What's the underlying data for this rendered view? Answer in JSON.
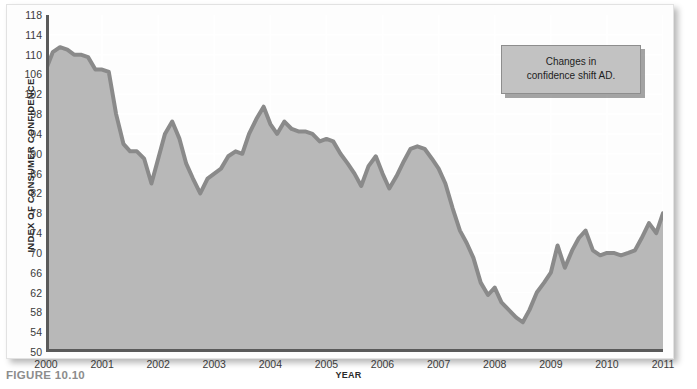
{
  "figure": {
    "caption": "FIGURE 10.10"
  },
  "annotation": {
    "line1": "Changes in",
    "line2": "confidence shift AD."
  },
  "colors": {
    "area_fill": "#b8b8b8",
    "line": "#8a8a8a",
    "gridline": "#ffffff",
    "axis": "#5a5a5a",
    "callout_fill": "#c2c2c2",
    "callout_border": "#8d8d8d",
    "caption_text": "#8c8c8c"
  },
  "chart_data": {
    "type": "area",
    "title": "",
    "subtitle": "",
    "xlabel": "YEAR",
    "ylabel": "INDEX OF CONSUMER CONFIDENCE",
    "xlim": [
      2000,
      2011
    ],
    "ylim": [
      50,
      118
    ],
    "grid": true,
    "legend": "none",
    "ytick_labels": [
      118,
      114,
      110,
      106,
      102,
      98,
      94,
      90,
      86,
      82,
      78,
      74,
      70,
      66,
      62,
      58,
      54,
      50
    ],
    "xtick_labels": [
      "2000",
      "2001",
      "2002",
      "2003",
      "2004",
      "2005",
      "2006",
      "2007",
      "2008",
      "2009",
      "2010",
      "2011"
    ],
    "series": [
      {
        "name": "Index of Consumer Confidence",
        "x": [
          2000.0,
          2000.12,
          2000.25,
          2000.38,
          2000.5,
          2000.62,
          2000.75,
          2000.88,
          2001.0,
          2001.12,
          2001.25,
          2001.38,
          2001.5,
          2001.62,
          2001.75,
          2001.88,
          2002.0,
          2002.12,
          2002.25,
          2002.38,
          2002.5,
          2002.62,
          2002.75,
          2002.88,
          2003.0,
          2003.12,
          2003.25,
          2003.38,
          2003.5,
          2003.62,
          2003.75,
          2003.88,
          2004.0,
          2004.12,
          2004.25,
          2004.38,
          2004.5,
          2004.62,
          2004.75,
          2004.88,
          2005.0,
          2005.12,
          2005.25,
          2005.38,
          2005.5,
          2005.62,
          2005.75,
          2005.88,
          2006.0,
          2006.12,
          2006.25,
          2006.38,
          2006.5,
          2006.62,
          2006.75,
          2006.88,
          2007.0,
          2007.12,
          2007.25,
          2007.38,
          2007.5,
          2007.62,
          2007.75,
          2007.88,
          2008.0,
          2008.12,
          2008.25,
          2008.38,
          2008.5,
          2008.62,
          2008.75,
          2008.88,
          2009.0,
          2009.12,
          2009.25,
          2009.38,
          2009.5,
          2009.62,
          2009.75,
          2009.88,
          2010.0,
          2010.12,
          2010.25,
          2010.38,
          2010.5,
          2010.62,
          2010.75,
          2010.88,
          2011.0
        ],
        "y": [
          107.0,
          110.5,
          111.5,
          111.0,
          110.0,
          110.0,
          109.5,
          107.0,
          107.0,
          106.5,
          98.0,
          92.0,
          90.5,
          90.5,
          89.0,
          84.0,
          89.0,
          94.0,
          96.5,
          93.0,
          88.0,
          85.0,
          82.0,
          85.0,
          86.0,
          87.0,
          89.5,
          90.5,
          90.0,
          94.0,
          97.0,
          99.5,
          96.0,
          94.0,
          96.5,
          95.0,
          94.5,
          94.5,
          94.0,
          92.5,
          93.0,
          92.5,
          90.0,
          88.0,
          86.0,
          83.5,
          87.5,
          89.5,
          86.0,
          83.0,
          85.5,
          88.5,
          91.0,
          91.5,
          91.0,
          89.0,
          87.0,
          84.0,
          79.0,
          74.5,
          72.0,
          69.0,
          64.0,
          61.5,
          63.0,
          60.0,
          58.5,
          57.0,
          56.0,
          58.5,
          62.0,
          64.0,
          66.0,
          71.5,
          67.0,
          70.5,
          73.0,
          74.5,
          70.5,
          69.5,
          70.0,
          70.0,
          69.5,
          70.0,
          70.5,
          73.0,
          76.0,
          74.0,
          78.0
        ]
      }
    ],
    "annotations": [
      {
        "text": "Changes in confidence shift AD.",
        "x": 2009.0,
        "y": 113
      }
    ]
  }
}
